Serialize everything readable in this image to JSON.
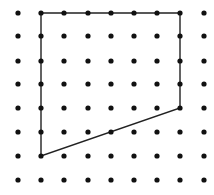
{
  "figure": {
    "type": "dot-grid-polygon",
    "grid": {
      "columns": 9,
      "rows": 8,
      "x_positions": [
        18,
        41,
        64,
        88,
        111,
        134,
        157,
        180,
        204
      ],
      "y_positions": [
        13,
        36,
        61,
        84,
        108,
        132,
        156,
        180
      ],
      "dot_radius": 2.6,
      "dot_color": "#111111"
    },
    "polygon": {
      "vertices_grid": [
        [
          1,
          0
        ],
        [
          7,
          0
        ],
        [
          7,
          4
        ],
        [
          1,
          6
        ]
      ],
      "stroke_color": "#222222",
      "stroke_width": 1.4,
      "fill": "none"
    }
  }
}
